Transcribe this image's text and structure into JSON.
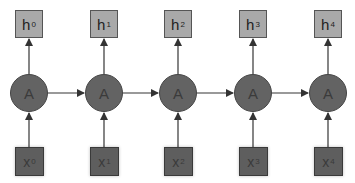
{
  "diagram": {
    "type": "unrolled-rnn",
    "colors": {
      "output_box": "#a9a9a9",
      "input_box": "#5e5e5e",
      "node": "#636363",
      "edge": "#444444"
    },
    "steps": [
      {
        "output": {
          "base": "h",
          "sub": "0"
        },
        "node": "A",
        "input": {
          "base": "x",
          "sub": "0"
        }
      },
      {
        "output": {
          "base": "h",
          "sub": "1"
        },
        "node": "A",
        "input": {
          "base": "x",
          "sub": "1"
        }
      },
      {
        "output": {
          "base": "h",
          "sub": "2"
        },
        "node": "A",
        "input": {
          "base": "x",
          "sub": "2"
        }
      },
      {
        "output": {
          "base": "h",
          "sub": "3"
        },
        "node": "A",
        "input": {
          "base": "x",
          "sub": "3"
        }
      },
      {
        "output": {
          "base": "h",
          "sub": "4"
        },
        "node": "A",
        "input": {
          "base": "x",
          "sub": "4"
        }
      }
    ]
  }
}
